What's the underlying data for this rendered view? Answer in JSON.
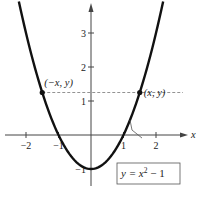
{
  "chart_data": {
    "type": "line",
    "title": "",
    "xlabel": "x",
    "ylabel": "y",
    "xlim": [
      -2.7,
      2.9
    ],
    "ylim": [
      -1.5,
      3.9
    ],
    "x_ticks": [
      {
        "value": -2,
        "label": "−2"
      },
      {
        "value": -1,
        "label": "−1"
      },
      {
        "value": 1,
        "label": "1"
      },
      {
        "value": 2,
        "label": "2"
      }
    ],
    "y_ticks": [
      {
        "value": 3,
        "label": "3"
      },
      {
        "value": 2,
        "label": "2"
      },
      {
        "value": 1,
        "label": "1"
      },
      {
        "value": -1,
        "label": "−1"
      }
    ],
    "grid": false,
    "series": [
      {
        "name": "y = x^2 - 1",
        "function": "x^2 - 1",
        "x_range": [
          -2.22,
          2.22
        ],
        "color": "#111111"
      }
    ],
    "points": [
      {
        "x": -1.5,
        "y": 1.25,
        "label": "(−x, y)"
      },
      {
        "x": 1.5,
        "y": 1.25,
        "label": "(x, y)"
      }
    ],
    "reference_line": {
      "y": 1.25,
      "x_from": -1.5,
      "x_to": 1.5,
      "style": "dashed"
    },
    "annotation": {
      "text_prefix": "y = x",
      "superscript": "2",
      "text_suffix": " − 1",
      "points_to": {
        "x": 1.2,
        "y": 0.44
      }
    },
    "x_axis_label": "x"
  }
}
